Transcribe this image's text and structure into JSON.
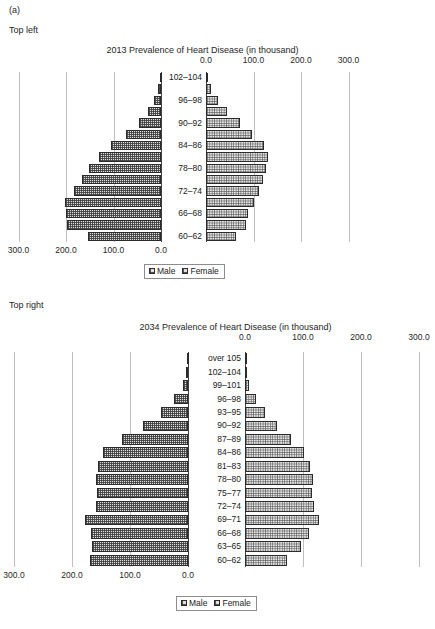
{
  "figure": {
    "caption": "(a)",
    "panels": [
      {
        "label": "Top left"
      },
      {
        "label": "Top right"
      }
    ]
  },
  "legend": {
    "male_label": "Male",
    "female_label": "Female",
    "male_swatch": "male-pattern-swatch",
    "female_swatch": "female-pattern-swatch"
  },
  "chart_data": [
    {
      "id": "chart-2013",
      "type": "bar",
      "subtype": "population-pyramid",
      "title": "2013 Prevalence of Heart Disease (in thousand)",
      "panel": "Top left",
      "xlabel": "",
      "ylabel": "",
      "xlim": [
        0,
        300
      ],
      "xticks": [
        "0.0",
        "100.0",
        "200.0",
        "300.0"
      ],
      "xtick_values": [
        0,
        100,
        200,
        300
      ],
      "grid": true,
      "legend_position": "bottom-center",
      "categories": [
        "60–62",
        "63–65",
        "66–68",
        "69–71",
        "72–74",
        "75–77",
        "78–80",
        "81–83",
        "84–86",
        "87–89",
        "90–92",
        "93–95",
        "96–98",
        "99–101",
        "102–104"
      ],
      "visible_category_labels": [
        "60–62",
        "",
        "66–68",
        "",
        "72–74",
        "",
        "78–80",
        "",
        "84–86",
        "",
        "90–92",
        "",
        "96–98",
        "",
        "102–104"
      ],
      "series": [
        {
          "name": "Male",
          "direction": "left",
          "values": [
            153,
            198,
            200,
            203,
            183,
            166,
            151,
            131,
            106,
            73,
            47,
            27,
            14,
            6,
            2
          ]
        },
        {
          "name": "Female",
          "direction": "right",
          "values": [
            64,
            85,
            88,
            102,
            112,
            119,
            127,
            130,
            123,
            97,
            72,
            45,
            25,
            10,
            3
          ]
        }
      ]
    },
    {
      "id": "chart-2034",
      "type": "bar",
      "subtype": "population-pyramid",
      "title": "2034 Prevalence of Heart Disease (in thousand)",
      "panel": "Top right",
      "xlabel": "",
      "ylabel": "",
      "xlim": [
        0,
        300
      ],
      "xticks": [
        "0.0",
        "100.0",
        "200.0",
        "300.0"
      ],
      "xtick_values": [
        0,
        100,
        200,
        300
      ],
      "grid": true,
      "legend_position": "bottom-center",
      "categories": [
        "60–62",
        "63–65",
        "66–68",
        "69–71",
        "72–74",
        "75–77",
        "78–80",
        "81–83",
        "84–86",
        "87–89",
        "90–92",
        "93–95",
        "96–98",
        "99–101",
        "102–104",
        "over 105"
      ],
      "visible_category_labels": [
        "60–62",
        "63–65",
        "66–68",
        "69–71",
        "72–74",
        "75–77",
        "78–80",
        "81–83",
        "84–86",
        "87–89",
        "90–92",
        "93–95",
        "96–98",
        "99–101",
        "102–104",
        "over 105"
      ],
      "series": [
        {
          "name": "Male",
          "direction": "left",
          "values": [
            169,
            165,
            167,
            178,
            158,
            157,
            158,
            156,
            147,
            113,
            77,
            47,
            24,
            9,
            3,
            1
          ]
        },
        {
          "name": "Female",
          "direction": "right",
          "values": [
            72,
            97,
            110,
            128,
            119,
            115,
            117,
            112,
            102,
            80,
            56,
            35,
            19,
            7,
            2,
            1
          ]
        }
      ]
    }
  ]
}
